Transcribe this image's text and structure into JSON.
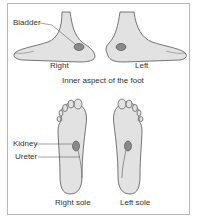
{
  "figure": {
    "top_labels": {
      "bladder": "Bladder",
      "right": "Right",
      "left": "Left",
      "caption": "Inner aspect of the foot"
    },
    "bottom_labels": {
      "kidney": "Kidney",
      "ureter": "Ureter",
      "right_sole": "Right sole",
      "left_sole": "Left sole"
    },
    "colors": {
      "foot_fill": "#e2e2e2",
      "outline": "#555555",
      "reflex_point": "#8a8a8a",
      "border": "#b8b8b8"
    }
  }
}
